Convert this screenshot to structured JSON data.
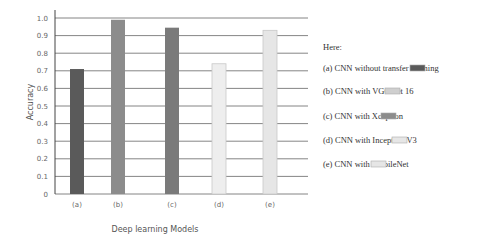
{
  "chart_data": {
    "type": "bar",
    "title": "",
    "xlabel": "Deep learning Models",
    "ylabel": "Accuracy",
    "ylim": [
      0,
      1.0
    ],
    "yticks": [
      "0",
      "0.1",
      "0.2",
      "0.3",
      "0.4",
      "0.5",
      "0.6",
      "0.7",
      "0.8",
      "0.9",
      "1.0"
    ],
    "grid": true,
    "categories": [
      "(a)",
      "(b)",
      "(c)",
      "(d)",
      "(e)"
    ],
    "values": [
      0.71,
      0.99,
      0.945,
      0.74,
      0.93
    ],
    "colors": [
      "#5a5a5a",
      "#8c8c8c",
      "#7a7a7a",
      "#eeeeee",
      "#e6e6e6"
    ],
    "legend": {
      "title": "Here:",
      "position": "right",
      "entries": [
        {
          "label": "(a) CNN without transfer learning",
          "color": "#5a5a5a"
        },
        {
          "label": "(b) CNN with VGGNet 16",
          "color": "#cfcfcf"
        },
        {
          "label": "(c) CNN with Xception",
          "color": "#8c8c8c"
        },
        {
          "label": "(d) CNN with Inception V3",
          "color": "#e6e6e6"
        },
        {
          "label": "(e) CNN with MobileNet",
          "color": "#e6e6e6"
        }
      ]
    }
  }
}
